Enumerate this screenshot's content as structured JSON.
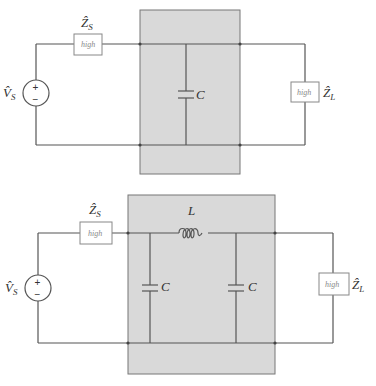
{
  "colors": {
    "wire": "#555555",
    "shaded_region": "#d9d9d9",
    "impedance_box_text": "#888888"
  },
  "circuits": [
    {
      "name": "single-capacitor-network",
      "source": {
        "label": "V̂",
        "subscript": "S",
        "plus": "+",
        "minus": "−"
      },
      "source_impedance": {
        "label": "Ẑ",
        "subscript": "S",
        "value": "high"
      },
      "load_impedance": {
        "label": "Ẑ",
        "subscript": "L",
        "value": "high"
      },
      "network": {
        "capacitor_label": "C"
      }
    },
    {
      "name": "pi-network",
      "source": {
        "label": "V̂",
        "subscript": "S",
        "plus": "+",
        "minus": "−"
      },
      "source_impedance": {
        "label": "Ẑ",
        "subscript": "S",
        "value": "high"
      },
      "load_impedance": {
        "label": "Ẑ",
        "subscript": "L",
        "value": "high"
      },
      "network": {
        "inductor_label": "L",
        "capacitor1_label": "C",
        "capacitor2_label": "C"
      }
    }
  ]
}
